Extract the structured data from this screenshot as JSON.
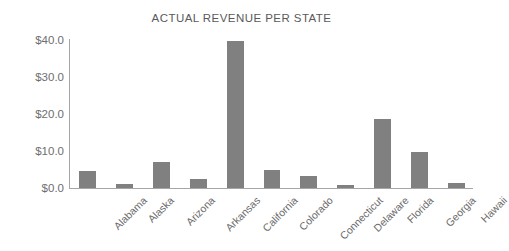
{
  "chart_data": {
    "type": "bar",
    "title": "ACTUAL REVENUE PER STATE",
    "xlabel": "",
    "ylabel": "",
    "categories": [
      "Alabama",
      "Alaska",
      "Arizona",
      "Arkansas",
      "California",
      "Colorado",
      "Connecticut",
      "Delaware",
      "Florida",
      "Georgia",
      "Hawaii"
    ],
    "values": [
      4.6,
      1.0,
      6.9,
      2.4,
      39.8,
      4.9,
      3.2,
      0.9,
      18.6,
      9.8,
      1.4
    ],
    "ylim": [
      0,
      40
    ],
    "ytick_values": [
      0,
      10,
      20,
      30,
      40
    ],
    "ytick_labels": [
      "$0.0",
      "$10.0",
      "$20.0",
      "$30.0",
      "$40.0"
    ],
    "grid": false,
    "legend": null,
    "bar_color": "#808080",
    "axis_color": "#a6a6a6",
    "title_color": "#5a5a5a",
    "tick_label_color": "#6e6e6e"
  }
}
